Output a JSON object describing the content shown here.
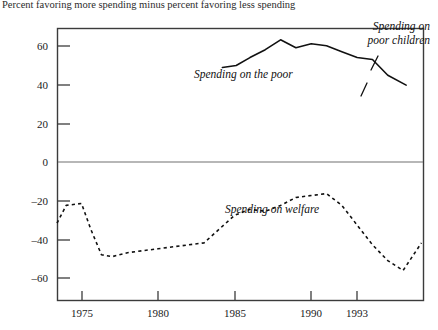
{
  "caption": "Percent favoring more spending minus percent favoring less spending",
  "axis": {
    "y_ticks": [
      "60",
      "40",
      "20",
      "0",
      "–20",
      "–40",
      "–60"
    ],
    "y_values": [
      60,
      40,
      20,
      0,
      -20,
      -40,
      -60
    ],
    "x_ticks": [
      "1975",
      "1980",
      "1985",
      "1990",
      "1993"
    ],
    "x_values": [
      1975,
      1980,
      1985,
      1990,
      1993
    ]
  },
  "labels": {
    "poor": "Spending on the poor",
    "poor_children_line1": "Spending on",
    "poor_children_line2": "poor children",
    "welfare": "Spending on welfare"
  },
  "colors": {
    "frame": "#3b3b3b",
    "zero_line": "#6f6f6f",
    "series_solid": "#111111",
    "series_dashed": "#111111",
    "text": "#1a1a1a"
  },
  "chart_data": {
    "type": "line",
    "title": "",
    "subtitle": "",
    "xlabel": "",
    "ylabel": "Percent favoring more spending minus percent favoring less spending",
    "xlim": [
      1973.4,
      1997.3
    ],
    "ylim": [
      -70,
      68
    ],
    "grid": false,
    "legend": "inline-annotations",
    "zero_reference_line": 0,
    "series": [
      {
        "name": "Spending on the poor",
        "style": "solid",
        "x": [
          1984.2,
          1985.1,
          1986.0,
          1987.0,
          1988.0,
          1989.0,
          1990.0,
          1991.0,
          1992.0,
          1993.0,
          1994.0,
          1995.0,
          1996.2
        ],
        "values": [
          48,
          49,
          53,
          57,
          62,
          58,
          60,
          59,
          56,
          53,
          52,
          44,
          39
        ]
      },
      {
        "name": "Spending on poor children",
        "style": "solid-annotated",
        "note": "label points to the 1993-1994 kink in the solid curve",
        "x": [
          1993.0,
          1994.0
        ],
        "values": [
          53,
          52
        ]
      },
      {
        "name": "Spending on welfare",
        "style": "dashed",
        "x": [
          1973.4,
          1974.0,
          1975.0,
          1975.6,
          1976.3,
          1977.0,
          1978.0,
          1979.0,
          1980.0,
          1981.0,
          1982.0,
          1983.0,
          1984.0,
          1985.0,
          1986.0,
          1987.0,
          1988.0,
          1989.0,
          1990.0,
          1991.0,
          1992.0,
          1993.0,
          1994.0,
          1995.0,
          1996.0,
          1997.2
        ],
        "values": [
          -31,
          -22,
          -21,
          -34,
          -47,
          -48,
          -46,
          -45,
          -44,
          -43,
          -42,
          -41,
          -34,
          -27,
          -24,
          -25,
          -22,
          -18,
          -17,
          -16,
          -22,
          -32,
          -42,
          -50,
          -55,
          -41
        ]
      }
    ]
  }
}
